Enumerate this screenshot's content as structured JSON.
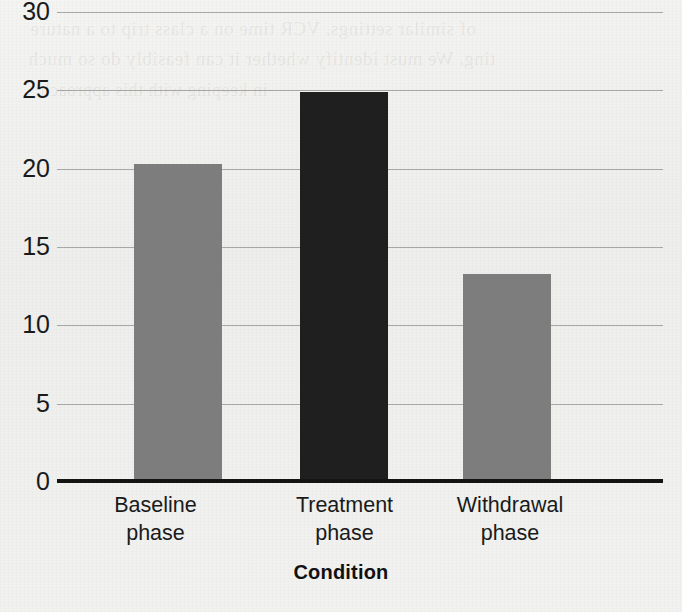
{
  "chart_data": {
    "type": "bar",
    "title": "",
    "subtitle": "",
    "xlabel": "Condition",
    "ylabel": "",
    "categories": [
      "Baseline phase",
      "Treatment phase",
      "Withdrawal phase"
    ],
    "category_lines": [
      [
        "Baseline",
        "phase"
      ],
      [
        "Treatment",
        "phase"
      ],
      [
        "Withdrawal",
        "phase"
      ]
    ],
    "values": [
      20.3,
      24.9,
      13.3
    ],
    "bar_colors": [
      "#7d7d7d",
      "#1f1f1f",
      "#7d7d7d"
    ],
    "ylim": [
      0,
      30
    ],
    "yticks": [
      0,
      5,
      10,
      15,
      20,
      25,
      30
    ],
    "ytick_labels": [
      "0",
      "5",
      "10",
      "15",
      "20",
      "25",
      "30"
    ],
    "grid": true,
    "grid_axis": "y",
    "legend": false,
    "legend_position": "none",
    "annotations": []
  },
  "style": {
    "background_color": "#f1f1ef",
    "gridline_color": "#9a9a9a",
    "axis_color": "#141414",
    "text_color": "#1a1a1a",
    "bar_gray": "#7d7d7d",
    "bar_black": "#1f1f1f"
  },
  "page_artifacts": {
    "description": "faint mirrored bleed-through text from reverse side of scanned page",
    "lines": [
      "of similar settings. VCR time on a class trip to a nature",
      "ting. We must identify whether it can feasibly do so much",
      "in keeping with this approach"
    ]
  }
}
